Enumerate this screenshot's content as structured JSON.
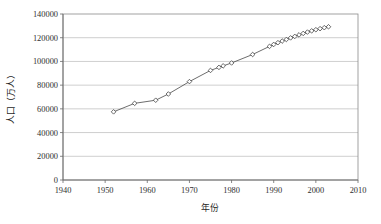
{
  "chart_data": {
    "type": "line",
    "title": "",
    "xlabel": "年份",
    "ylabel": "人口（万人）",
    "xlim": [
      1940,
      2010
    ],
    "ylim": [
      0,
      140000
    ],
    "xticks": [
      1940,
      1950,
      1960,
      1970,
      1980,
      1990,
      2000,
      2010
    ],
    "xtick_labels": [
      "1940",
      "1950",
      "1960",
      "1970",
      "1980",
      "1990",
      "2000",
      "2010"
    ],
    "yticks": [
      0,
      20000,
      40000,
      60000,
      80000,
      100000,
      120000,
      140000
    ],
    "ytick_labels": [
      "0",
      "20000",
      "40000",
      "60000",
      "80000",
      "100000",
      "120000",
      "140000"
    ],
    "grid": "horizontal",
    "legend": "none",
    "marker": "open-diamond",
    "series": [
      {
        "name": "人口（万人）",
        "x": [
          1952,
          1957,
          1962,
          1965,
          1970,
          1975,
          1977,
          1978,
          1980,
          1985,
          1989,
          1990,
          1991,
          1992,
          1993,
          1994,
          1995,
          1996,
          1997,
          1998,
          1999,
          2000,
          2001,
          2002,
          2003
        ],
        "values": [
          57482,
          64653,
          67295,
          72538,
          82992,
          92420,
          94974,
          96259,
          98705,
          105851,
          112704,
          114333,
          115823,
          117171,
          118517,
          119850,
          121121,
          122389,
          123626,
          124761,
          125786,
          126743,
          127627,
          128453,
          129227
        ]
      }
    ]
  },
  "axis": {
    "y_title": "人口（万人）",
    "x_title": "年份"
  }
}
